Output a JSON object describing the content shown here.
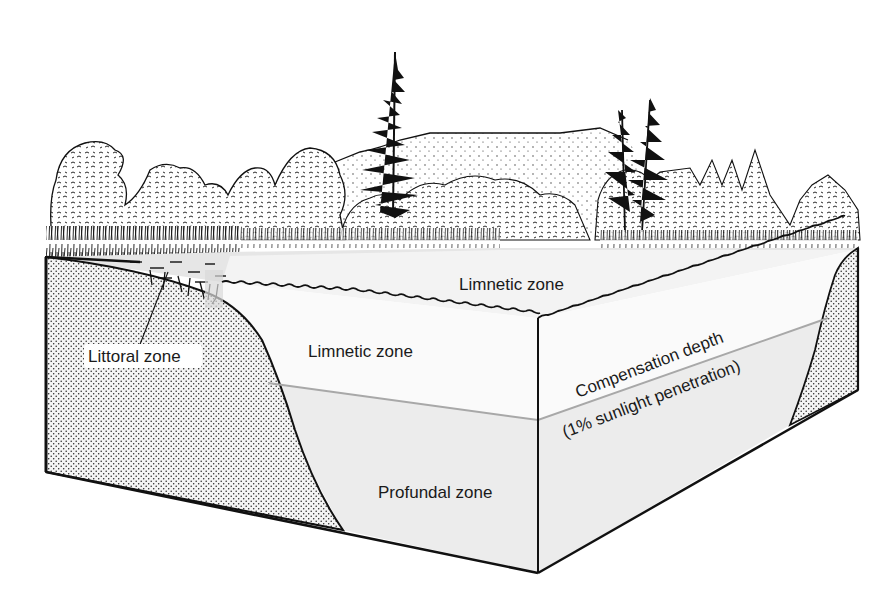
{
  "diagram": {
    "type": "lake-cross-section",
    "colors": {
      "background": "#ffffff",
      "ink": "#111111",
      "water_upper": "#f7f7f7",
      "water_lower": "#ebebeb",
      "water_surface": "#e2e2e2",
      "sediment": "#f2f2f2",
      "compensation_line": "#a8a8a8"
    },
    "labels": {
      "littoral": "Littoral zone",
      "limnetic_surface": "Limnetic zone",
      "limnetic_front": "Limnetic zone",
      "compensation_depth": "Compensation depth",
      "compensation_note": "(1% sunlight penetration)",
      "profundal": "Profundal zone"
    },
    "scene_elements": [
      "deciduous-trees",
      "conifer-trees",
      "distant-hill",
      "emergent-reeds",
      "lake-surface",
      "littoral-sediment",
      "limnetic-water",
      "profundal-water"
    ]
  }
}
